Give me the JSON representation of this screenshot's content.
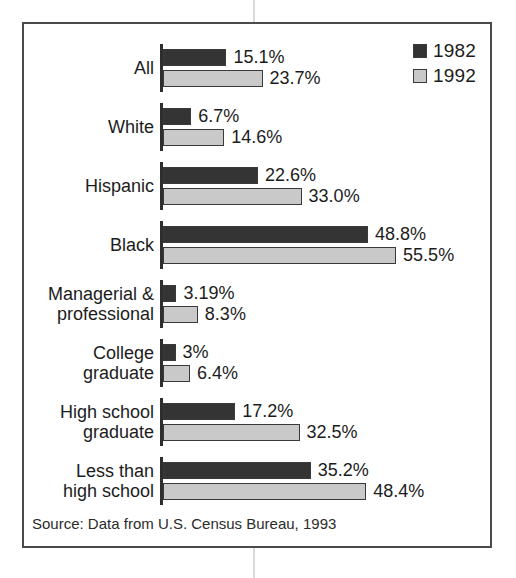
{
  "chart_data": {
    "type": "bar",
    "orientation": "horizontal",
    "title": "",
    "xlabel": "",
    "ylabel": "",
    "grid": false,
    "legend_position": "top-right",
    "value_suffix": "%",
    "xlim": [
      0,
      60
    ],
    "categories": [
      "All",
      "White",
      "Hispanic",
      "Black",
      "Managerial &\nprofessional",
      "College\ngraduate",
      "High school\ngraduate",
      "Less than\nhigh school"
    ],
    "series": [
      {
        "name": "1982",
        "color": "#343434",
        "values": [
          15.1,
          6.7,
          22.6,
          48.8,
          3.19,
          3,
          17.2,
          35.2
        ],
        "labels": [
          "15.1%",
          "6.7%",
          "22.6%",
          "48.8%",
          "3.19%",
          "3%",
          "17.2%",
          "35.2%"
        ]
      },
      {
        "name": "1992",
        "color": "#c9c9c9",
        "values": [
          23.7,
          14.6,
          33.0,
          55.5,
          8.3,
          6.4,
          32.5,
          48.4
        ],
        "labels": [
          "23.7%",
          "14.6%",
          "33.0%",
          "55.5%",
          "8.3%",
          "6.4%",
          "32.5%",
          "48.4%"
        ]
      }
    ],
    "source_note": "Source: Data from U.S. Census Bureau, 1993"
  },
  "legend": {
    "items": [
      {
        "label": "1982",
        "swatch_class": "s1982"
      },
      {
        "label": "1992",
        "swatch_class": "s1992"
      }
    ]
  }
}
